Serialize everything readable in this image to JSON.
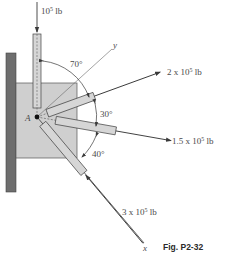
{
  "figure": {
    "caption": "Fig. P2-32",
    "point_label": "A",
    "axes": {
      "x_label": "x",
      "y_label": "y"
    },
    "forces": [
      {
        "id": "vertical",
        "label": "10",
        "exp": "5",
        "unit": " lb"
      },
      {
        "id": "upper",
        "label": "2 x 10",
        "exp": "5",
        "unit": " lb"
      },
      {
        "id": "middle",
        "label": "1.5 x 10",
        "exp": "5",
        "unit": " lb"
      },
      {
        "id": "lower",
        "label": "3 x 10",
        "exp": "5",
        "unit": " lb"
      }
    ],
    "angles": [
      {
        "id": "a70",
        "label": "70°"
      },
      {
        "id": "a30",
        "label": "30°"
      },
      {
        "id": "a40",
        "label": "40°"
      }
    ],
    "colors": {
      "wall": "#6e6e6e",
      "plate": "#cfcfcf",
      "member": "#d6d6d6",
      "line": "#3a3a3a"
    }
  }
}
